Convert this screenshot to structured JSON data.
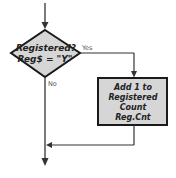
{
  "diagram": {
    "type": "flowchart",
    "decision": {
      "line1": "Registered?",
      "line2": "Reg$ = \"Y\""
    },
    "process": {
      "line1": "Add 1 to",
      "line2": "Registered",
      "line3": "Count",
      "line4": "Reg.Cnt"
    },
    "edges": {
      "yes_label": "Yes",
      "no_label": "No"
    },
    "colors": {
      "shape_fill": "#d6d6d6",
      "stroke": "#1a1a1a",
      "line": "#333333"
    }
  }
}
